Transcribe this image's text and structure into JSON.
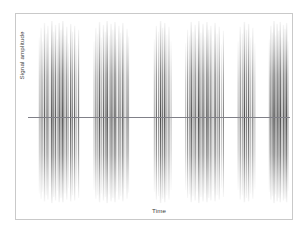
{
  "figure": {
    "background_color": "#ffffff",
    "frame_color": "#c9c9c9",
    "zero_line_color": "#808088"
  },
  "chart_data": {
    "type": "line",
    "title": "",
    "subtitle": "",
    "xlabel": "Time",
    "ylabel": "Signal amplitude",
    "grid": false,
    "legend": null,
    "legend_position": "none",
    "xlim": [
      0,
      100
    ],
    "ylim": [
      -1,
      1
    ],
    "xticks": [],
    "yticks": [],
    "annotations": [],
    "baseline_y": 0,
    "series": [
      {
        "name": "burst-1",
        "x_start": 4.0,
        "x_end": 19.5,
        "spikes": [
          {
            "x": 4.3,
            "up": 0.82,
            "down": 0.88,
            "weight": 0.3
          },
          {
            "x": 5.0,
            "up": 0.92,
            "down": 0.94,
            "weight": 0.52
          },
          {
            "x": 5.6,
            "up": 0.78,
            "down": 0.86,
            "weight": 0.38
          },
          {
            "x": 6.3,
            "up": 0.97,
            "down": 0.97,
            "weight": 0.72
          },
          {
            "x": 7.0,
            "up": 0.86,
            "down": 0.9,
            "weight": 0.44
          },
          {
            "x": 7.6,
            "up": 0.94,
            "down": 0.95,
            "weight": 0.66
          },
          {
            "x": 8.4,
            "up": 0.72,
            "down": 0.8,
            "weight": 0.26
          },
          {
            "x": 9.1,
            "up": 0.99,
            "down": 0.99,
            "weight": 0.88
          },
          {
            "x": 9.8,
            "up": 0.88,
            "down": 0.92,
            "weight": 0.58
          },
          {
            "x": 10.5,
            "up": 0.95,
            "down": 0.96,
            "weight": 0.74
          },
          {
            "x": 11.2,
            "up": 0.8,
            "down": 0.85,
            "weight": 0.34
          },
          {
            "x": 11.9,
            "up": 0.97,
            "down": 0.98,
            "weight": 0.8
          },
          {
            "x": 12.6,
            "up": 0.9,
            "down": 0.93,
            "weight": 0.62
          },
          {
            "x": 13.3,
            "up": 0.99,
            "down": 0.98,
            "weight": 0.9
          },
          {
            "x": 14.1,
            "up": 0.84,
            "down": 0.88,
            "weight": 0.46
          },
          {
            "x": 14.8,
            "up": 0.93,
            "down": 0.95,
            "weight": 0.68
          },
          {
            "x": 15.5,
            "up": 0.76,
            "down": 0.82,
            "weight": 0.3
          },
          {
            "x": 16.3,
            "up": 0.96,
            "down": 0.97,
            "weight": 0.78
          },
          {
            "x": 17.0,
            "up": 0.88,
            "down": 0.9,
            "weight": 0.5
          },
          {
            "x": 17.8,
            "up": 0.94,
            "down": 0.96,
            "weight": 0.7
          },
          {
            "x": 18.6,
            "up": 0.74,
            "down": 0.8,
            "weight": 0.28
          },
          {
            "x": 19.3,
            "up": 0.9,
            "down": 0.93,
            "weight": 0.56
          }
        ]
      },
      {
        "name": "burst-2",
        "x_start": 25.0,
        "x_end": 38.5,
        "spikes": [
          {
            "x": 25.2,
            "up": 0.78,
            "down": 0.84,
            "weight": 0.3
          },
          {
            "x": 25.9,
            "up": 0.92,
            "down": 0.94,
            "weight": 0.58
          },
          {
            "x": 26.6,
            "up": 0.86,
            "down": 0.9,
            "weight": 0.42
          },
          {
            "x": 27.3,
            "up": 0.98,
            "down": 0.98,
            "weight": 0.84
          },
          {
            "x": 28.0,
            "up": 0.82,
            "down": 0.88,
            "weight": 0.36
          },
          {
            "x": 28.8,
            "up": 0.95,
            "down": 0.96,
            "weight": 0.72
          },
          {
            "x": 29.5,
            "up": 0.88,
            "down": 0.92,
            "weight": 0.54
          },
          {
            "x": 30.2,
            "up": 0.99,
            "down": 0.99,
            "weight": 0.9
          },
          {
            "x": 31.0,
            "up": 0.84,
            "down": 0.89,
            "weight": 0.4
          },
          {
            "x": 31.7,
            "up": 0.96,
            "down": 0.97,
            "weight": 0.76
          },
          {
            "x": 32.4,
            "up": 0.9,
            "down": 0.93,
            "weight": 0.6
          },
          {
            "x": 33.2,
            "up": 0.98,
            "down": 0.98,
            "weight": 0.86
          },
          {
            "x": 33.9,
            "up": 0.8,
            "down": 0.86,
            "weight": 0.34
          },
          {
            "x": 34.7,
            "up": 0.94,
            "down": 0.95,
            "weight": 0.68
          },
          {
            "x": 35.4,
            "up": 0.87,
            "down": 0.91,
            "weight": 0.48
          },
          {
            "x": 36.2,
            "up": 0.97,
            "down": 0.97,
            "weight": 0.8
          },
          {
            "x": 37.0,
            "up": 0.76,
            "down": 0.83,
            "weight": 0.28
          },
          {
            "x": 37.8,
            "up": 0.91,
            "down": 0.94,
            "weight": 0.62
          },
          {
            "x": 38.4,
            "up": 0.83,
            "down": 0.87,
            "weight": 0.38
          }
        ]
      },
      {
        "name": "burst-3",
        "x_start": 48.0,
        "x_end": 55.0,
        "spikes": [
          {
            "x": 48.2,
            "up": 0.8,
            "down": 0.86,
            "weight": 0.34
          },
          {
            "x": 49.0,
            "up": 0.94,
            "down": 0.95,
            "weight": 0.64
          },
          {
            "x": 49.8,
            "up": 0.88,
            "down": 0.91,
            "weight": 0.46
          },
          {
            "x": 50.6,
            "up": 0.99,
            "down": 0.99,
            "weight": 0.88
          },
          {
            "x": 51.4,
            "up": 0.92,
            "down": 0.94,
            "weight": 0.66
          },
          {
            "x": 52.2,
            "up": 0.97,
            "down": 0.98,
            "weight": 0.82
          },
          {
            "x": 53.0,
            "up": 0.85,
            "down": 0.9,
            "weight": 0.44
          },
          {
            "x": 53.8,
            "up": 0.93,
            "down": 0.95,
            "weight": 0.6
          },
          {
            "x": 54.6,
            "up": 0.78,
            "down": 0.84,
            "weight": 0.3
          }
        ]
      },
      {
        "name": "burst-4",
        "x_start": 60.0,
        "x_end": 75.0,
        "spikes": [
          {
            "x": 60.2,
            "up": 0.76,
            "down": 0.84,
            "weight": 0.3
          },
          {
            "x": 60.9,
            "up": 0.9,
            "down": 0.93,
            "weight": 0.56
          },
          {
            "x": 61.6,
            "up": 0.84,
            "down": 0.89,
            "weight": 0.4
          },
          {
            "x": 62.3,
            "up": 0.98,
            "down": 0.98,
            "weight": 0.84
          },
          {
            "x": 63.0,
            "up": 0.88,
            "down": 0.91,
            "weight": 0.52
          },
          {
            "x": 63.8,
            "up": 0.95,
            "down": 0.96,
            "weight": 0.74
          },
          {
            "x": 64.5,
            "up": 0.81,
            "down": 0.86,
            "weight": 0.36
          },
          {
            "x": 65.2,
            "up": 0.99,
            "down": 0.99,
            "weight": 0.92
          },
          {
            "x": 66.0,
            "up": 0.87,
            "down": 0.92,
            "weight": 0.54
          },
          {
            "x": 66.8,
            "up": 0.96,
            "down": 0.97,
            "weight": 0.78
          },
          {
            "x": 67.5,
            "up": 0.83,
            "down": 0.88,
            "weight": 0.42
          },
          {
            "x": 68.3,
            "up": 0.98,
            "down": 0.98,
            "weight": 0.86
          },
          {
            "x": 69.0,
            "up": 0.9,
            "down": 0.93,
            "weight": 0.62
          },
          {
            "x": 69.8,
            "up": 0.94,
            "down": 0.96,
            "weight": 0.7
          },
          {
            "x": 70.6,
            "up": 0.79,
            "down": 0.85,
            "weight": 0.32
          },
          {
            "x": 71.4,
            "up": 0.97,
            "down": 0.97,
            "weight": 0.8
          },
          {
            "x": 72.2,
            "up": 0.86,
            "down": 0.9,
            "weight": 0.48
          },
          {
            "x": 73.0,
            "up": 0.93,
            "down": 0.95,
            "weight": 0.66
          },
          {
            "x": 73.8,
            "up": 0.75,
            "down": 0.82,
            "weight": 0.28
          },
          {
            "x": 74.6,
            "up": 0.89,
            "down": 0.92,
            "weight": 0.52
          }
        ]
      },
      {
        "name": "burst-5",
        "x_start": 80.0,
        "x_end": 87.0,
        "spikes": [
          {
            "x": 80.2,
            "up": 0.78,
            "down": 0.84,
            "weight": 0.32
          },
          {
            "x": 81.0,
            "up": 0.93,
            "down": 0.95,
            "weight": 0.62
          },
          {
            "x": 81.8,
            "up": 0.86,
            "down": 0.9,
            "weight": 0.44
          },
          {
            "x": 82.6,
            "up": 0.98,
            "down": 0.98,
            "weight": 0.86
          },
          {
            "x": 83.4,
            "up": 0.9,
            "down": 0.93,
            "weight": 0.58
          },
          {
            "x": 84.2,
            "up": 0.96,
            "down": 0.97,
            "weight": 0.76
          },
          {
            "x": 85.0,
            "up": 0.82,
            "down": 0.88,
            "weight": 0.38
          },
          {
            "x": 85.8,
            "up": 0.92,
            "down": 0.94,
            "weight": 0.6
          },
          {
            "x": 86.6,
            "up": 0.76,
            "down": 0.83,
            "weight": 0.28
          }
        ]
      },
      {
        "name": "burst-6",
        "x_start": 92.0,
        "x_end": 99.5,
        "spikes": [
          {
            "x": 92.1,
            "up": 0.8,
            "down": 0.86,
            "weight": 0.34
          },
          {
            "x": 92.7,
            "up": 0.94,
            "down": 0.95,
            "weight": 0.66
          },
          {
            "x": 93.3,
            "up": 0.87,
            "down": 0.91,
            "weight": 0.46
          },
          {
            "x": 93.9,
            "up": 0.99,
            "down": 0.99,
            "weight": 0.9
          },
          {
            "x": 94.5,
            "up": 0.84,
            "down": 0.89,
            "weight": 0.4
          },
          {
            "x": 95.1,
            "up": 0.96,
            "down": 0.97,
            "weight": 0.78
          },
          {
            "x": 95.7,
            "up": 0.89,
            "down": 0.93,
            "weight": 0.56
          },
          {
            "x": 96.3,
            "up": 0.98,
            "down": 0.98,
            "weight": 0.84
          },
          {
            "x": 96.9,
            "up": 0.82,
            "down": 0.87,
            "weight": 0.38
          },
          {
            "x": 97.5,
            "up": 0.95,
            "down": 0.96,
            "weight": 0.72
          },
          {
            "x": 98.1,
            "up": 0.91,
            "down": 0.94,
            "weight": 0.62
          },
          {
            "x": 98.7,
            "up": 0.97,
            "down": 0.98,
            "weight": 0.82
          },
          {
            "x": 99.3,
            "up": 0.78,
            "down": 0.85,
            "weight": 0.3
          }
        ]
      }
    ]
  }
}
